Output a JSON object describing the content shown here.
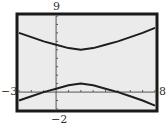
{
  "chart_data": {
    "type": "line",
    "title": "",
    "xlabel": "",
    "ylabel": "",
    "xlim": [
      -3,
      8
    ],
    "ylim": [
      -2,
      9
    ],
    "grid": false,
    "x_tick_spacing": 1,
    "y_tick_spacing": 1,
    "window_labels": {
      "xmin": "−3",
      "xmax": "8",
      "ymin": "−2",
      "ymax": "9"
    },
    "series": [
      {
        "name": "upper branch",
        "x": [
          -3,
          -2,
          -1,
          0,
          1,
          2,
          3,
          4,
          5,
          6,
          7,
          8
        ],
        "y": [
          7.0,
          6.5,
          6.0,
          5.6,
          5.2,
          5.0,
          5.2,
          5.6,
          6.0,
          6.5,
          7.0,
          7.6
        ]
      },
      {
        "name": "lower branch",
        "x": [
          -3,
          -2,
          -1,
          0,
          1,
          2,
          3,
          4,
          5,
          6,
          7,
          8
        ],
        "y": [
          -1.0,
          -0.5,
          0.0,
          0.4,
          0.8,
          1.0,
          0.8,
          0.4,
          0.0,
          -0.5,
          -1.0,
          -1.6
        ]
      }
    ],
    "colors": {
      "screen": "#ebebeb",
      "frame": "#1a1a1a",
      "curve": "#1e1e1e",
      "axis": "#555555"
    }
  }
}
